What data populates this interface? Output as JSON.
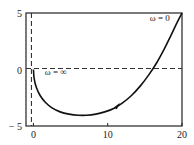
{
  "chart_data": {
    "type": "line",
    "title": "",
    "xlabel": "",
    "ylabel": "",
    "xlim": [
      -1,
      20
    ],
    "ylim": [
      -5,
      5
    ],
    "xticks": [
      {
        "value": 0,
        "label": "0"
      },
      {
        "value": 10,
        "label": "10"
      },
      {
        "value": 20,
        "label": "20"
      }
    ],
    "yticks": [
      {
        "value": 5,
        "label": "5"
      },
      {
        "value": 0,
        "label": "0"
      },
      {
        "value": -5,
        "label": "− 5"
      }
    ],
    "grid": false,
    "reference_lines": [
      {
        "orientation": "horizontal",
        "value": 0,
        "style": "dashed"
      },
      {
        "orientation": "vertical",
        "value": 0,
        "style": "dashed"
      }
    ],
    "series": [
      {
        "name": "Nyquist locus",
        "x": [
          0,
          0.1,
          0.4,
          0.9,
          1.6,
          2.5,
          3.6,
          4.8,
          6.0,
          7.2,
          8.4,
          9.6,
          10.8,
          12.0,
          13.2,
          14.4,
          15.5,
          16.6,
          17.6,
          18.5,
          19.3,
          20.0
        ],
        "y": [
          0,
          -0.8,
          -1.6,
          -2.3,
          -2.9,
          -3.4,
          -3.75,
          -3.95,
          -4.05,
          -4.05,
          -3.95,
          -3.75,
          -3.45,
          -2.95,
          -2.3,
          -1.45,
          -0.5,
          0.6,
          1.8,
          3.0,
          4.1,
          5.0
        ],
        "direction_arrow_at": {
          "x": 11.5,
          "y": -3.2
        }
      }
    ],
    "annotations": [
      {
        "text": "ω = 0",
        "near": {
          "x": 17,
          "y": 4.3
        }
      },
      {
        "text": "ω = ∞",
        "near": {
          "x": 3,
          "y": -0.5
        }
      }
    ]
  }
}
